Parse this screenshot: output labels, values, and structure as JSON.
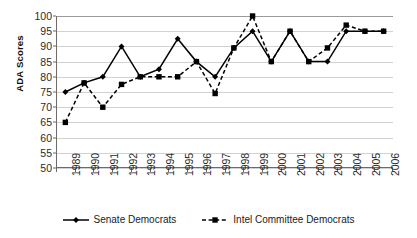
{
  "chart_data": {
    "type": "line",
    "title": "",
    "subtitle": "",
    "xlabel": "",
    "ylabel": "ADA Scores",
    "ylim": [
      50,
      100
    ],
    "ytick_step": 5,
    "yticks": [
      100,
      95,
      90,
      85,
      80,
      75,
      70,
      65,
      60,
      55,
      50
    ],
    "grid": true,
    "legend_position": "bottom",
    "categories": [
      "1989",
      "1990",
      "1991",
      "1992",
      "1993",
      "1994",
      "1995",
      "1996",
      "1997",
      "1998",
      "1999",
      "2000",
      "2001",
      "2002",
      "2003",
      "2004",
      "2005",
      "2006"
    ],
    "series": [
      {
        "name": "Senate Democrats",
        "style": "solid",
        "marker": "diamond",
        "color": "#000000",
        "values": [
          75,
          78,
          80,
          90,
          80,
          82.5,
          92.5,
          85,
          80,
          89.5,
          95,
          85,
          95,
          85,
          85,
          95,
          95,
          95
        ]
      },
      {
        "name": "Intel Committee Democrats",
        "style": "dashed",
        "marker": "square",
        "color": "#000000",
        "values": [
          65,
          78,
          70,
          77.5,
          80,
          80,
          80,
          85,
          74.5,
          89.5,
          100,
          85,
          95,
          85,
          89.5,
          97,
          95,
          95
        ]
      }
    ]
  },
  "legend": {
    "entries": [
      {
        "label": "Senate Democrats",
        "marker": "diamond-marker-icon",
        "line": "solid"
      },
      {
        "label": "Intel Committee Democrats",
        "marker": "square-marker-icon",
        "line": "dashed"
      }
    ]
  },
  "colors": {
    "series": "#000000",
    "gridline": "#d2d2d2",
    "axis": "#6b6b6b",
    "text": "#1a1a1a",
    "background": "#ffffff"
  }
}
